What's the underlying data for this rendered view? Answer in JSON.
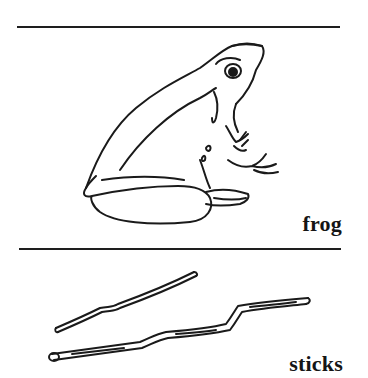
{
  "page": {
    "type": "picture-word-card",
    "colors": {
      "background": "#ffffff",
      "ink": "#1a1a1a"
    }
  },
  "cards": [
    {
      "label": "frog",
      "illustration": "frog-drawing"
    },
    {
      "label": "sticks",
      "illustration": "sticks-drawing"
    }
  ]
}
